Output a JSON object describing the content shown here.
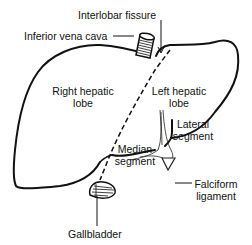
{
  "diagram": {
    "type": "anatomical-illustration",
    "labels": {
      "interlobar_fissure": "Interlobar fissure",
      "inferior_vena_cava": "Inferior vena cava",
      "right_hepatic_lobe_line1": "Right hepatic",
      "right_hepatic_lobe_line2": "lobe",
      "left_hepatic_lobe_line1": "Left hepatic",
      "left_hepatic_lobe_line2": "lobe",
      "lateral_segment_line1": "Lateral",
      "lateral_segment_line2": "segment",
      "median_segment_line1": "Median",
      "median_segment_line2": "segment",
      "falciform_ligament_line1": "Falciform",
      "falciform_ligament_line2": "ligament",
      "gallbladder": "Gallbladder"
    },
    "colors": {
      "ink": "#111111",
      "background": "#ffffff"
    }
  }
}
